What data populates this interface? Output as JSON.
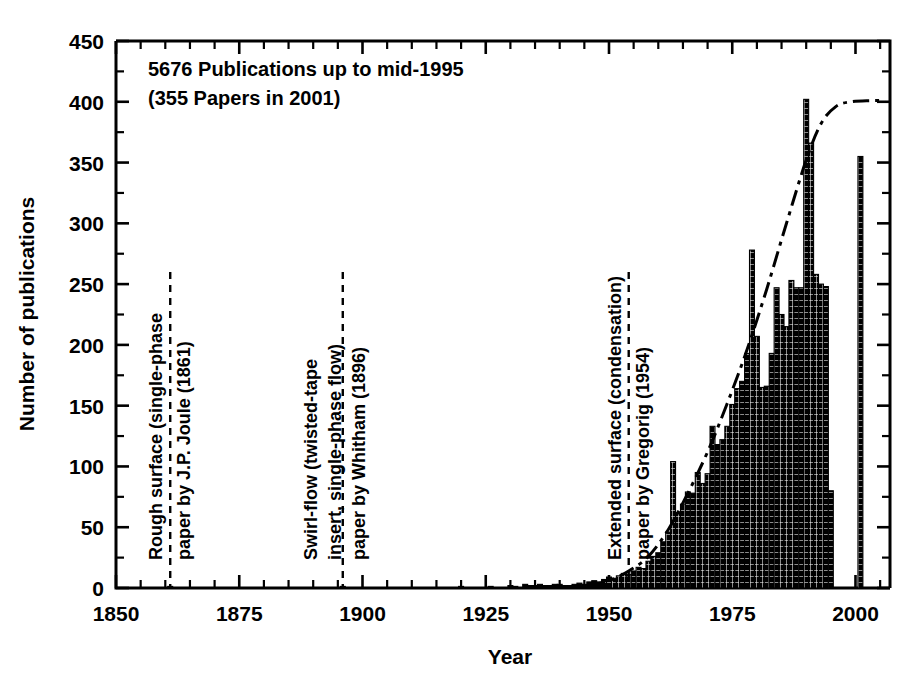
{
  "chart_data": {
    "type": "bar",
    "title": "",
    "xlabel": "Year",
    "ylabel": "Number of publications",
    "xlim": [
      1850,
      2007
    ],
    "ylim": [
      0,
      450
    ],
    "ytick_step": 50,
    "yminor_step": 25,
    "xtick_step": 25,
    "xminor_step": 5,
    "grid": false,
    "legend": "none",
    "xticklabels": [
      "1850",
      "1875",
      "1900",
      "1925",
      "1950",
      "1975",
      "2000"
    ],
    "yticklabels": [
      "0",
      "50",
      "100",
      "150",
      "200",
      "250",
      "300",
      "350",
      "400",
      "450"
    ],
    "bar_fill": "#000000",
    "bar_edge": "#000000",
    "series": [
      {
        "name": "Publications per year",
        "x": [
          1861,
          1896,
          1920,
          1926,
          1930,
          1931,
          1933,
          1934,
          1935,
          1936,
          1937,
          1938,
          1939,
          1940,
          1941,
          1942,
          1943,
          1944,
          1945,
          1946,
          1947,
          1948,
          1949,
          1950,
          1951,
          1952,
          1953,
          1954,
          1955,
          1956,
          1957,
          1958,
          1959,
          1960,
          1961,
          1962,
          1963,
          1964,
          1965,
          1966,
          1967,
          1968,
          1969,
          1970,
          1971,
          1972,
          1973,
          1974,
          1975,
          1976,
          1977,
          1978,
          1979,
          1980,
          1981,
          1982,
          1983,
          1984,
          1985,
          1986,
          1987,
          1988,
          1989,
          1990,
          1991,
          1992,
          1993,
          1994,
          1995,
          2001
        ],
        "values": [
          1,
          1,
          1,
          1,
          2,
          1,
          3,
          2,
          2,
          3,
          2,
          2,
          3,
          3,
          2,
          2,
          3,
          4,
          3,
          5,
          6,
          5,
          7,
          9,
          8,
          10,
          12,
          11,
          14,
          17,
          16,
          22,
          26,
          29,
          38,
          46,
          104,
          62,
          69,
          79,
          78,
          95,
          86,
          94,
          133,
          118,
          122,
          133,
          151,
          164,
          170,
          193,
          278,
          207,
          165,
          166,
          193,
          247,
          225,
          215,
          253,
          247,
          247,
          402,
          366,
          258,
          250,
          248,
          80,
          355
        ]
      }
    ],
    "cumulative_curve": {
      "name": "cumulative trend",
      "style": "dash-dot",
      "x": [
        1946,
        1950,
        1954,
        1958,
        1962,
        1966,
        1970,
        1974,
        1978,
        1982,
        1986,
        1990,
        1993,
        1996,
        1999,
        2003,
        2006
      ],
      "values": [
        2,
        6,
        14,
        26,
        48,
        78,
        112,
        152,
        196,
        246,
        300,
        352,
        382,
        396,
        400,
        401,
        401
      ]
    },
    "notes": [
      "5676 Publications up to mid-1995",
      "(355 Papers in 2001)"
    ],
    "markers": [
      {
        "year": 1861,
        "lines": [
          "Rough surface (single-phase",
          "paper by J.P. Joule (1861)"
        ]
      },
      {
        "year": 1896,
        "lines": [
          "Swirl-flow (twisted-tape",
          "insert, single-phase flow)",
          "paper by Whitham (1896)"
        ]
      },
      {
        "year": 1954,
        "lines": [
          "Extended surface (condensation)",
          "paper by Gregorig (1954)"
        ]
      }
    ]
  }
}
